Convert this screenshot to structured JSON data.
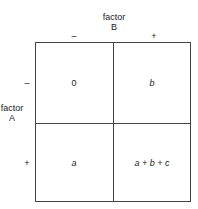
{
  "factor_b": {
    "label_line1": "factor",
    "label_line2": "B",
    "levels": [
      "–",
      "+"
    ]
  },
  "factor_a": {
    "label_line1": "factor",
    "label_line2": "A",
    "levels": [
      "–",
      "+"
    ]
  },
  "cells": {
    "minus_minus": "0",
    "minus_plus": "b",
    "plus_minus": "a",
    "plus_plus": "a + b + c"
  }
}
